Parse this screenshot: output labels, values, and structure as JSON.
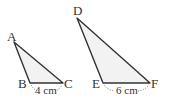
{
  "diagram": {
    "type": "similar-triangles",
    "triangles": [
      {
        "name": "ABC",
        "vertices": {
          "A": {
            "label": "A",
            "x": 14,
            "y": 42
          },
          "B": {
            "label": "B",
            "x": 30,
            "y": 83
          },
          "C": {
            "label": "C",
            "x": 63,
            "y": 83
          }
        },
        "base_measure": "4 cm"
      },
      {
        "name": "DEF",
        "vertices": {
          "D": {
            "label": "D",
            "x": 77,
            "y": 18
          },
          "E": {
            "label": "E",
            "x": 103,
            "y": 83
          },
          "F": {
            "label": "F",
            "x": 150,
            "y": 83
          }
        },
        "base_measure": "6 cm"
      }
    ],
    "colors": {
      "stroke": "#333333",
      "fill": "#f2f2f2",
      "text": "#333333"
    }
  }
}
